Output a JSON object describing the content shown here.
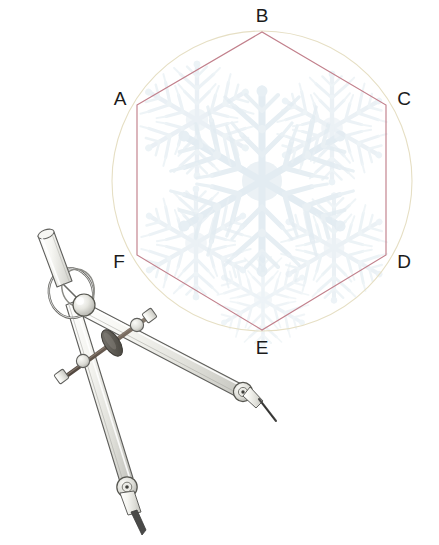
{
  "figure": {
    "background_color": "#ffffff",
    "hexagon_stroke": "#c2808c",
    "circle_stroke": "#e8e2c8",
    "snowflake_color": "#e9f0f4",
    "metal_light": "#f4f4f0",
    "metal_mid": "#d8d8d2",
    "metal_dark": "#8e8e88",
    "outline": "#5b5b58",
    "rod_color": "#6f6258",
    "tip_color": "#4a4a48"
  },
  "geometry": {
    "circle": {
      "cx": 262,
      "cy": 181,
      "r": 150
    },
    "hexagon": {
      "cx": 262,
      "cy": 181,
      "r": 149
    }
  },
  "vertices": [
    {
      "id": "A",
      "label": "A",
      "x": 137,
      "y": 105,
      "label_x": 120,
      "label_y": 100
    },
    {
      "id": "B",
      "label": "B",
      "x": 262,
      "y": 32,
      "label_x": 262,
      "label_y": 17
    },
    {
      "id": "C",
      "label": "C",
      "x": 386,
      "y": 105,
      "label_x": 404,
      "label_y": 100
    },
    {
      "id": "D",
      "label": "D",
      "x": 386,
      "y": 255,
      "label_x": 404,
      "label_y": 263
    },
    {
      "id": "E",
      "label": "E",
      "x": 262,
      "y": 330,
      "label_x": 262,
      "label_y": 349
    },
    {
      "id": "F",
      "label": "F",
      "x": 137,
      "y": 255,
      "label_x": 119,
      "label_y": 263
    }
  ],
  "compass": {
    "name": "drafting-compass",
    "parts": [
      {
        "id": "handle",
        "label": "knurled-handle"
      },
      {
        "id": "ring",
        "label": "finger-ring"
      },
      {
        "id": "hinge",
        "label": "hinge-knob"
      },
      {
        "id": "left-leg",
        "label": "pencil-leg"
      },
      {
        "id": "right-leg",
        "label": "needle-leg"
      },
      {
        "id": "crossbar",
        "label": "adjustment-crossbar"
      },
      {
        "id": "adjust-nut",
        "label": "adjustment-nut"
      },
      {
        "id": "left-collar",
        "label": "left-leg-collar"
      },
      {
        "id": "right-collar",
        "label": "right-leg-collar"
      },
      {
        "id": "pencil-tip",
        "label": "pencil-tip"
      },
      {
        "id": "needle-tip",
        "label": "needle-tip"
      }
    ]
  }
}
